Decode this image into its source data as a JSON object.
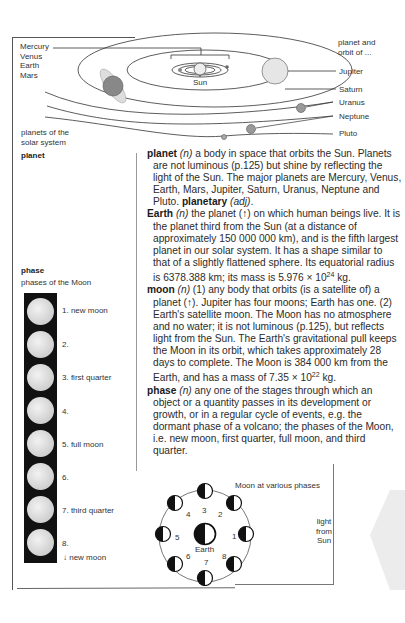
{
  "solar_diagram": {
    "inner_planets_labels": [
      "Mercury",
      "Venus",
      "Earth",
      "Mars"
    ],
    "sun_label": "Sun",
    "caption": "planets of the solar system",
    "header_note": "planet and orbit of ...",
    "outer_planet_labels": [
      "Jupiter",
      "Saturn",
      "Uranus",
      "Neptune",
      "Pluto"
    ]
  },
  "sidebar": {
    "planet_heading": "planet",
    "phase_heading": "phase",
    "phase_caption": "phases of the Moon",
    "phases": [
      {
        "label": "1. new moon"
      },
      {
        "label": "2."
      },
      {
        "label": "3. first quarter"
      },
      {
        "label": "4."
      },
      {
        "label": "5. full moon"
      },
      {
        "label": "6."
      },
      {
        "label": "7. third quarter"
      },
      {
        "label": "8."
      }
    ],
    "footer": "↓ new moon"
  },
  "entries": {
    "planet": {
      "headword": "planet",
      "pos": "(n)",
      "text": " a body in space that orbits the Sun. Planets are not luminous (p.125) but shine by reflecting the light of the Sun. The major planets are Mercury, Venus, Earth, Mars, Jupiter, Saturn, Uranus, Neptune and Pluto. ",
      "derived": "planetary",
      "derived_pos": "(adj)",
      "end": "."
    },
    "earth": {
      "headword": "Earth",
      "pos": "(n)",
      "text": " the planet (↑) on which human beings live. It is the planet third from the Sun (at a distance of approximately 150 000 000 km), and is the fifth largest planet in our solar system. It has a shape similar to that of a slightly flattened sphere. Its equatorial radius is 6378.388 km; its mass is 5.976 × 10",
      "exp": "24",
      "tail": " kg."
    },
    "moon": {
      "headword": "moon",
      "pos": "(n)",
      "text": " (1) any body that orbits (is a satellite of) a planet (↑). Jupiter has four moons; Earth has one. (2) Earth's satellite moon. The Moon has no atmosphere and no water; it is not luminous (p.125), but reflects light from the Sun. The Earth's gravitational pull keeps the Moon in its orbit, which takes approximately 28 days to complete. The Moon is 384 000 km from the Earth, and has a mass of 7.35 × 10",
      "exp": "22",
      "tail": " kg."
    },
    "phase": {
      "headword": "phase",
      "pos": "(n)",
      "text": " any one of the stages through which an object or a quantity passes in its development or growth, or in a regular cycle of events, e.g. the dormant phase of a volcano; the phases of the Moon, i.e. new moon, first quarter, full moon, and third quarter."
    }
  },
  "moon_diagram": {
    "title": "Moon at various phases",
    "center_label": "Earth",
    "numbers": [
      "1",
      "2",
      "3",
      "4",
      "5",
      "6",
      "7",
      "8"
    ],
    "light_label": [
      "light",
      "from",
      "Sun"
    ]
  }
}
